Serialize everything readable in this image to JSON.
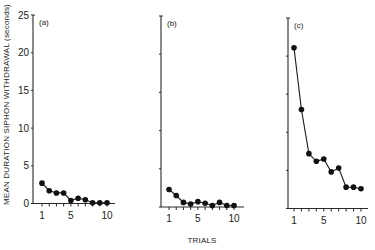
{
  "figure": {
    "ylabel": "MEAN DURATION SIPHON WITHDRAWAL (seconds)",
    "xlabel": "TRIALS"
  },
  "chart_data": [
    {
      "type": "line",
      "panel": "(a)",
      "title": "",
      "xlabel": "",
      "ylabel": "MEAN DURATION SIPHON WITHDRAWAL (seconds)",
      "x": [
        1,
        2,
        3,
        4,
        5,
        6,
        7,
        8,
        9,
        10
      ],
      "values": [
        2.7,
        1.7,
        1.4,
        1.4,
        0.4,
        0.7,
        0.5,
        0.1,
        0.1,
        0.1
      ],
      "ylim": [
        0,
        25
      ],
      "yticks": [
        0,
        5,
        10,
        15,
        20,
        25
      ],
      "xticks": [
        1,
        5,
        10
      ],
      "grid": false,
      "legend": null
    },
    {
      "type": "line",
      "panel": "(b)",
      "title": "",
      "xlabel": "TRIALS",
      "ylabel": "",
      "x": [
        1,
        2,
        3,
        4,
        5,
        6,
        7,
        8,
        9,
        10
      ],
      "values": [
        2.3,
        1.5,
        0.6,
        0.4,
        0.7,
        0.5,
        0.2,
        0.6,
        0.2,
        0.2
      ],
      "ylim": [
        0,
        25
      ],
      "yticks": [
        0,
        5,
        10,
        15,
        20,
        25
      ],
      "xticks": [
        1,
        5,
        10
      ],
      "grid": false,
      "legend": null
    },
    {
      "type": "line",
      "panel": "(c)",
      "title": "",
      "xlabel": "",
      "ylabel": "",
      "x": [
        1,
        2,
        3,
        4,
        5,
        6,
        7,
        8,
        9,
        10
      ],
      "values": [
        21.1,
        13.0,
        7.2,
        6.2,
        6.5,
        4.8,
        5.3,
        2.8,
        2.8,
        2.6
      ],
      "ylim": [
        0,
        25
      ],
      "yticks": [
        0,
        5,
        10,
        15,
        20,
        25
      ],
      "xticks": [
        1,
        5,
        10
      ],
      "grid": false,
      "legend": null
    }
  ],
  "layout": {
    "panels": [
      {
        "axis_x": 33,
        "top": 15,
        "baseline": 203.5,
        "x1": 42,
        "x10": 107,
        "x_end": 115,
        "show_tick_labels": true
      },
      {
        "axis_x": 161,
        "top": 16,
        "baseline": 207,
        "x1": 169,
        "x10": 234,
        "x_end": 244,
        "show_tick_labels": false
      },
      {
        "axis_x": 288,
        "top": 18,
        "baseline": 208.5,
        "x1": 294,
        "x10": 361,
        "x_end": 368,
        "show_tick_labels": false
      }
    ]
  }
}
